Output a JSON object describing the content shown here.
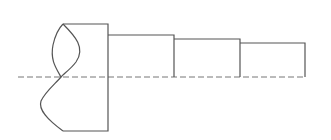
{
  "diagram": {
    "type": "stepped-shaft-half-section",
    "colors": {
      "stroke": "#555555",
      "centerline": "#777777",
      "background": "#ffffff"
    },
    "centerline": {
      "x1": 18,
      "x2": 306,
      "y": 77
    },
    "sections": [
      {
        "name": "collar",
        "x1": 63,
        "x2": 108,
        "top": 24,
        "bottom": 131
      },
      {
        "name": "step-1",
        "x1": 108,
        "x2": 174,
        "top": 35,
        "bottom": 77
      },
      {
        "name": "step-2",
        "x1": 174,
        "x2": 240,
        "top": 39,
        "bottom": 77
      },
      {
        "name": "step-3",
        "x1": 240,
        "x2": 305,
        "top": 43,
        "bottom": 77
      }
    ],
    "break_line": "S-curve break symbol on left end of collar"
  }
}
